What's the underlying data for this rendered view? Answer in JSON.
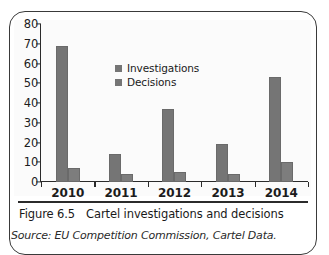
{
  "figure": {
    "caption_number": "Figure 6.5",
    "caption_title": "Cartel investigations and decisions",
    "source": "Source: EU Competition Commission, Cartel Data."
  },
  "colors": {
    "bar": "#757575",
    "axis": "#2b2b2b",
    "frame": "#3a3a3a",
    "plot_background": "#fbfbfb"
  },
  "chart_data": {
    "type": "bar",
    "title": "",
    "xlabel": "",
    "ylabel": "",
    "ylim": [
      0,
      80
    ],
    "yticks": [
      0,
      10,
      20,
      30,
      40,
      50,
      60,
      70,
      80
    ],
    "ytick_labels": [
      "0",
      "10",
      "20",
      "30",
      "40",
      "50",
      "60",
      "70",
      "80"
    ],
    "grid": false,
    "legend_position": "upper center",
    "categories": [
      "2010",
      "2011",
      "2012",
      "2013",
      "2014"
    ],
    "series": [
      {
        "name": "Investigations",
        "values": [
          69,
          14,
          37,
          19,
          53
        ]
      },
      {
        "name": "Decisions",
        "values": [
          7,
          4,
          5,
          4,
          10
        ]
      }
    ]
  }
}
